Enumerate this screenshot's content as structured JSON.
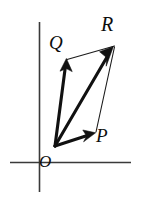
{
  "figure": {
    "width": 141,
    "height": 204,
    "background_color": "#ffffff",
    "ink_color": "#111111",
    "axis_color": "#3a3a3a"
  },
  "axes": {
    "x_axis": {
      "name": "horizontal-axis",
      "x1": 10,
      "y1": 162.5,
      "x2": 131,
      "y2": 162.5
    },
    "y_axis": {
      "name": "vertical-axis",
      "x1": 39.5,
      "y1": 22,
      "x2": 39.5,
      "y2": 192
    },
    "origin": {
      "x": 55,
      "y": 146
    }
  },
  "labels": {
    "R": "R",
    "Q": "Q",
    "P": "P",
    "O": "O"
  },
  "vectors": [
    {
      "name": "vector-OQ",
      "label": "Q",
      "from": {
        "x": 55,
        "y": 146
      },
      "to": {
        "x": 66,
        "y": 61
      },
      "style": "bold-arrow"
    },
    {
      "name": "vector-OR",
      "label": "R",
      "from": {
        "x": 55,
        "y": 146
      },
      "to": {
        "x": 113,
        "y": 47
      },
      "style": "bold-arrow"
    },
    {
      "name": "vector-OP",
      "label": "P",
      "from": {
        "x": 55,
        "y": 146
      },
      "to": {
        "x": 95,
        "y": 133
      },
      "style": "bold-arrow"
    }
  ],
  "guides": [
    {
      "name": "guide-Q-to-R",
      "from": {
        "x": 67,
        "y": 59
      },
      "to": {
        "x": 114,
        "y": 46
      }
    },
    {
      "name": "guide-P-to-R",
      "from": {
        "x": 96,
        "y": 132
      },
      "to": {
        "x": 114,
        "y": 47
      }
    }
  ]
}
